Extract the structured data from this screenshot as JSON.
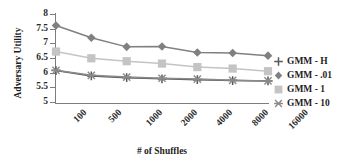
{
  "chart_data": {
    "type": "line",
    "title": "",
    "xlabel": "# of Shuffles",
    "ylabel": "Adversary Utility",
    "categories": [
      "100",
      "500",
      "1000",
      "2000",
      "4000",
      "8000",
      "16000"
    ],
    "ylim": [
      5,
      8
    ],
    "yticks": [
      "5",
      "5.5",
      "6",
      "6.5",
      "7",
      "7.5",
      "8"
    ],
    "ytick_values": [
      5,
      5.5,
      6,
      6.5,
      7,
      7.5,
      8
    ],
    "grid": false,
    "legend_position": "right",
    "series": [
      {
        "name": "GMM - H",
        "marker": "plus",
        "color": "#595959",
        "values": [
          6.07,
          5.89,
          5.83,
          5.79,
          5.76,
          5.73,
          5.72
        ]
      },
      {
        "name": "GMM - .01",
        "marker": "diamond",
        "color": "#808080",
        "values": [
          7.61,
          7.19,
          6.88,
          6.89,
          6.69,
          6.67,
          6.58
        ]
      },
      {
        "name": "GMM - 1",
        "marker": "square",
        "color": "#c4c4c4",
        "values": [
          6.72,
          6.49,
          6.39,
          6.31,
          6.19,
          6.14,
          6.05
        ]
      },
      {
        "name": "GMM - 10",
        "marker": "star-x",
        "color": "#8a8a8a",
        "values": [
          6.08,
          5.91,
          5.85,
          5.81,
          5.78,
          5.74,
          5.72
        ]
      }
    ]
  },
  "axes": {
    "y_title": "Adversary Utility",
    "x_title": "# of Shuffles"
  },
  "legend": {
    "items": [
      {
        "label": "GMM - H"
      },
      {
        "label": "GMM - .01"
      },
      {
        "label": "GMM - 1"
      },
      {
        "label": "GMM - 10"
      }
    ]
  },
  "colors": {
    "axis": "#7d7d7d",
    "text": "#1d1d1d",
    "series_h": "#595959",
    "series_001": "#808080",
    "series_1": "#c4c4c4",
    "series_10": "#8a8a8a"
  }
}
